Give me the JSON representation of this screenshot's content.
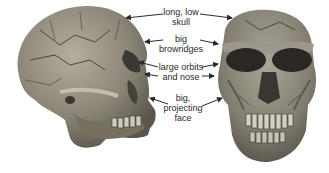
{
  "figure": {
    "views": [
      {
        "name": "side-view",
        "description": "lateral view of fossil skull"
      },
      {
        "name": "front-view",
        "description": "frontal view of fossil skull"
      }
    ],
    "annotations": [
      {
        "id": "skull",
        "lines": [
          "long, low",
          "skull"
        ]
      },
      {
        "id": "browridges",
        "lines": [
          "big",
          "browridges"
        ]
      },
      {
        "id": "orbits",
        "lines": [
          "large orbits",
          "and nose"
        ]
      },
      {
        "id": "face",
        "lines": [
          "big,",
          "projecting",
          "face"
        ]
      }
    ],
    "colors": {
      "bone_light": "#a9a597",
      "bone_mid": "#7c776b",
      "bone_dark": "#4a463f",
      "socket": "#2a2724",
      "text": "#2a2a2a",
      "background": "#ffffff"
    }
  }
}
